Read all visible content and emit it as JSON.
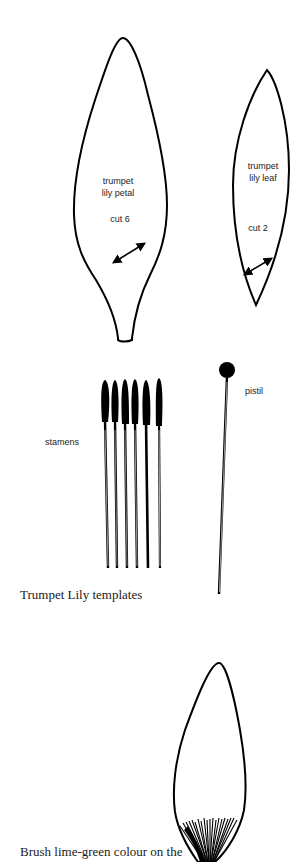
{
  "petal": {
    "title_line1": "trumpet",
    "title_line2": "lily petal",
    "cut": "cut 6"
  },
  "leaf": {
    "title_line1": "trumpet",
    "title_line2": "lily leaf",
    "cut": "cut 2"
  },
  "stamens": {
    "label": "stamens",
    "count": 6
  },
  "pistil": {
    "label": "pistil"
  },
  "captions": {
    "templates": "Trumpet Lily templates",
    "instruction": "Brush lime-green colour on the"
  },
  "colors": {
    "ink": "#000000",
    "text": "#222222",
    "background": "#ffffff"
  }
}
